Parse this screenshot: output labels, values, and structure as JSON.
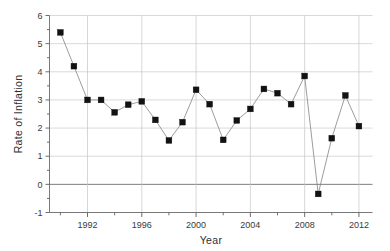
{
  "chart_data": {
    "type": "line",
    "title": "",
    "subtitle": "",
    "xlabel": "Year",
    "ylabel": "Rate of Inflation",
    "xlim": [
      1989.2,
      2013.0
    ],
    "ylim": [
      -1,
      6
    ],
    "grid": true,
    "legend": "none",
    "marker": "filled-square",
    "marker_color": "#121212",
    "line_color": "#8a8a8a",
    "x_tick_labels": [
      "1992",
      "1996",
      "2000",
      "2004",
      "2008",
      "2012"
    ],
    "x_tick_values": [
      1992,
      1996,
      2000,
      2004,
      2008,
      2012
    ],
    "x_minor_tick_values": [
      1990,
      1991,
      1993,
      1994,
      1995,
      1997,
      1998,
      1999,
      2001,
      2002,
      2003,
      2005,
      2006,
      2007,
      2009,
      2010,
      2011
    ],
    "y_tick_labels": [
      "-1",
      "0",
      "1",
      "2",
      "3",
      "4",
      "5",
      "6"
    ],
    "y_tick_values": [
      -1,
      0,
      1,
      2,
      3,
      4,
      5,
      6
    ],
    "x": [
      1990,
      1991,
      1992,
      1993,
      1994,
      1995,
      1996,
      1997,
      1998,
      1999,
      2000,
      2001,
      2002,
      2003,
      2004,
      2005,
      2006,
      2007,
      2008,
      2009,
      2010,
      2011,
      2012
    ],
    "values": [
      5.4,
      4.2,
      3.0,
      3.0,
      2.56,
      2.83,
      2.95,
      2.29,
      1.56,
      2.21,
      3.36,
      2.85,
      1.58,
      2.27,
      2.68,
      3.39,
      3.24,
      2.85,
      3.85,
      -0.34,
      1.64,
      3.16,
      2.07
    ],
    "series": [
      {
        "name": "Rate of Inflation",
        "values": [
          5.4,
          4.2,
          3.0,
          3.0,
          2.56,
          2.83,
          2.95,
          2.29,
          1.56,
          2.21,
          3.36,
          2.85,
          1.58,
          2.27,
          2.68,
          3.39,
          3.24,
          2.85,
          3.85,
          -0.34,
          1.64,
          3.16,
          2.07
        ]
      }
    ]
  }
}
